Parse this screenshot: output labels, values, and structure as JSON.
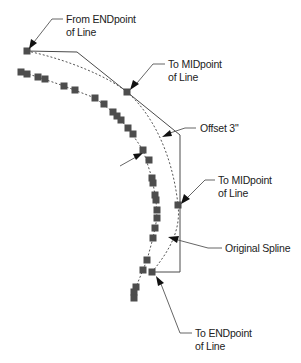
{
  "diagram": {
    "colors": {
      "line": "#4a4a4a",
      "marker": "#4d4d4d",
      "text": "#222222",
      "background": "#ffffff"
    },
    "callouts": {
      "from_endpoint": {
        "line1": "From ENDpoint",
        "line2": "of Line"
      },
      "to_midpoint_top": {
        "line1": "To MIDpoint",
        "line2": "of Line"
      },
      "offset": {
        "line1": "Offset 3\""
      },
      "to_midpoint_right": {
        "line1": "To MIDpoint",
        "line2": "of Line"
      },
      "original_spline": {
        "line1": "Original Spline"
      },
      "to_endpoint": {
        "line1": "To ENDpoint",
        "line2": "of Line"
      }
    }
  }
}
